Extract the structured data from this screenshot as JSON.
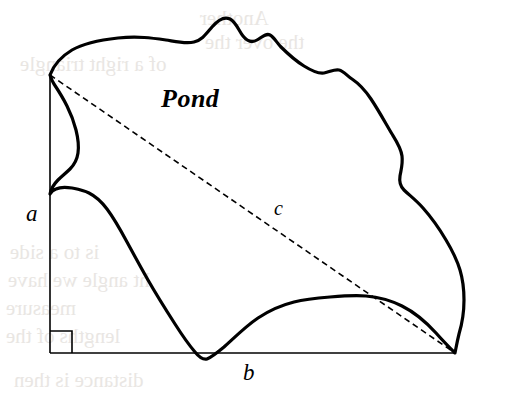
{
  "figure": {
    "type": "geometry-diagram",
    "width": 508,
    "height": 402,
    "background_color": "#ffffff",
    "stroke_color": "#000000"
  },
  "labels": {
    "region": "Pond",
    "leg_vertical": "a",
    "leg_horizontal": "b",
    "hypotenuse": "c"
  },
  "geometry": {
    "triangle": {
      "vertex_top": [
        50,
        75
      ],
      "vertex_corner": [
        50,
        353
      ],
      "vertex_right": [
        455,
        353
      ],
      "right_angle_marker": {
        "x": 50,
        "y": 331,
        "size": 22
      },
      "leg_vertical_style": "solid",
      "leg_horizontal_style": "solid",
      "hypotenuse_style": "dashed"
    },
    "stroke_widths": {
      "pond_outline": 3.2,
      "triangle_legs": 1.6,
      "hypotenuse_dash": 1.6,
      "right_angle_marker": 1.6
    },
    "dash_pattern": "6 4",
    "pond_outline_path": "M 50,75 C 54,64 62,56 72,50 C 84,43 100,40 118,38 C 138,36 152,38 166,40 C 178,42 186,44 194,42 C 202,40 206,34 212,27 C 218,20 224,16 230,19 C 236,22 239,31 243,36 C 247,41 252,43 257,40 C 262,37 266,33 270,35 C 274,37 277,43 281,47 C 288,54 296,61 304,66 C 312,71 318,74 324,73 C 330,72 334,69 339,70 C 344,71 347,76 352,79 C 358,83 365,90 371,99 C 379,111 386,124 392,134 C 397,142 401,148 402,156 C 403,164 401,170 400,176 C 399,182 400,186 404,190 C 409,195 416,200 423,208 C 431,217 439,228 446,240 C 452,250 457,260 460,270 C 463,280 464,290 464,300 C 464,312 462,324 459,334 C 457,342 456,348 455,353 C 451,349 444,342 436,333 C 426,322 414,312 402,306 C 390,300 378,297 366,296 C 354,295 342,296 330,297 C 318,298 306,299 294,302 C 282,305 270,310 258,318 C 246,326 234,338 224,347 C 218,352 212,357 207,359 C 203,360 199,357 195,352 C 189,345 182,335 175,324 C 166,310 156,294 148,280 C 140,266 133,253 127,242 C 120,229 113,217 107,209 C 101,201 95,196 89,193 C 83,190 77,189 72,188 C 66,187 60,187 56,189 C 53,190 51,192 50,194 C 51,189 54,184 58,180 C 62,176 66,173 70,169 C 74,165 77,160 78,153 C 79,146 78,138 76,130 C 74,122 71,114 67,106 C 63,98 58,90 54,84 C 52,81 51,78 50,75 Z"
  },
  "annotations": {
    "showthrough_note": "faint mirrored print show-through from reverse page"
  }
}
